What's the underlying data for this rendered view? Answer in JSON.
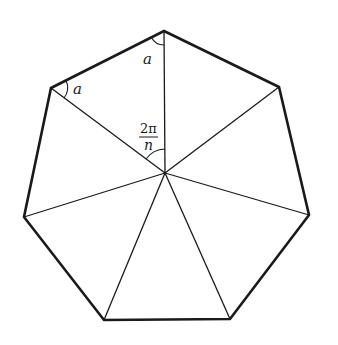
{
  "diagram": {
    "shape": "regular-heptagon",
    "sides": 7,
    "center": [
      165,
      173
    ],
    "vertices": [
      [
        164,
        31
      ],
      [
        279,
        87
      ],
      [
        309,
        215
      ],
      [
        230,
        319
      ],
      [
        104,
        320
      ],
      [
        24,
        217
      ],
      [
        51,
        88
      ]
    ],
    "labels": {
      "angle_top": "a",
      "angle_left": "a",
      "central_angle_numerator": "2π",
      "central_angle_denominator": "n"
    },
    "colors": {
      "stroke": "#1a1a1a",
      "background": "#ffffff"
    }
  }
}
